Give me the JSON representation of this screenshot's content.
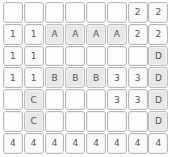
{
  "puzzle": {
    "rows": 8,
    "cols": 8,
    "colors": {
      "empty": "#fdfdfd",
      "number": "#fafafa",
      "letter": "#e8e8e8",
      "border": "#b8b8b8",
      "text": "#555555"
    },
    "grid": [
      [
        "",
        "",
        "",
        "",
        "",
        "",
        "2",
        "2"
      ],
      [
        "1",
        "1",
        "A",
        "A",
        "A",
        "A",
        "2",
        "2"
      ],
      [
        "1",
        "1",
        "",
        "",
        "",
        "",
        "",
        "D"
      ],
      [
        "1",
        "1",
        "B",
        "B",
        "B",
        "3",
        "3",
        "D"
      ],
      [
        "",
        "C",
        "",
        "",
        "",
        "3",
        "3",
        "D"
      ],
      [
        "",
        "C",
        "",
        "",
        "",
        "",
        "",
        "D"
      ],
      [
        "4",
        "4",
        "4",
        "4",
        "4",
        "4",
        "4",
        "4"
      ]
    ]
  }
}
